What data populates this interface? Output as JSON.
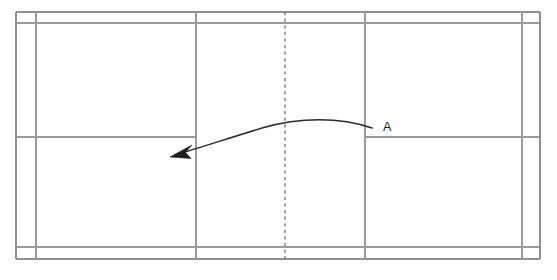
{
  "diagram": {
    "kind": "badminton-court-diagram",
    "background_color": "#ffffff"
  },
  "colors": {
    "court_line": "#9a9a9a",
    "court_line_strong": "#8f8f8f",
    "net_line": "#6f6f6f",
    "shot_path": "#2b2b2b",
    "label_text": "#1a1a1a"
  },
  "court": {
    "orientation": "horizontal",
    "outer_boundary": {
      "x": 16,
      "y": 12,
      "width": 524,
      "height": 247
    },
    "vertical_lines_x": [
      16,
      36,
      196,
      285,
      365,
      522,
      540
    ],
    "horizontal_lines_y": [
      12,
      23,
      137,
      247,
      259
    ],
    "lines": [
      {
        "name": "left-doubles-long-service-line",
        "type": "vertical",
        "x": 16,
        "y1": 12,
        "y2": 259
      },
      {
        "name": "left-singles-side-line",
        "type": "vertical",
        "x": 36,
        "y1": 12,
        "y2": 259
      },
      {
        "name": "left-short-service-line",
        "type": "vertical",
        "x": 196,
        "y1": 12,
        "y2": 259
      },
      {
        "name": "net-center-line",
        "type": "vertical-dashed",
        "x": 285,
        "y1": 12,
        "y2": 259
      },
      {
        "name": "right-short-service-line",
        "type": "vertical",
        "x": 365,
        "y1": 12,
        "y2": 259
      },
      {
        "name": "right-singles-side-line",
        "type": "vertical",
        "x": 522,
        "y1": 12,
        "y2": 259
      },
      {
        "name": "right-doubles-long-service-line",
        "type": "vertical",
        "x": 540,
        "y1": 12,
        "y2": 259
      },
      {
        "name": "top-outer-side-line",
        "type": "horizontal",
        "y": 12,
        "x1": 16,
        "x2": 540
      },
      {
        "name": "top-doubles-side-line",
        "type": "horizontal",
        "y": 23,
        "x1": 16,
        "x2": 540
      },
      {
        "name": "left-center-service-line",
        "type": "horizontal",
        "y": 137,
        "x1": 16,
        "x2": 196
      },
      {
        "name": "right-center-service-line",
        "type": "horizontal",
        "y": 137,
        "x1": 365,
        "x2": 540
      },
      {
        "name": "bottom-doubles-side-line",
        "type": "horizontal",
        "y": 247,
        "x1": 16,
        "x2": 540
      },
      {
        "name": "bottom-outer-side-line",
        "type": "horizontal",
        "y": 259,
        "x1": 16,
        "x2": 540
      }
    ]
  },
  "shot": {
    "label": "A",
    "label_position": {
      "x": 384,
      "y": 130
    },
    "start": {
      "x": 372,
      "y": 128
    },
    "end": {
      "x": 171,
      "y": 156
    },
    "apex": {
      "x": 290,
      "y": 121
    },
    "path": "M372,128 C340,118 300,118 262,128 C225,138 195,148 174,155",
    "arrowhead": "M171,156 L190,146 L185,152 L191,157 Z",
    "direction": "right-to-left",
    "curve": "arc over net toward far forecourt"
  }
}
